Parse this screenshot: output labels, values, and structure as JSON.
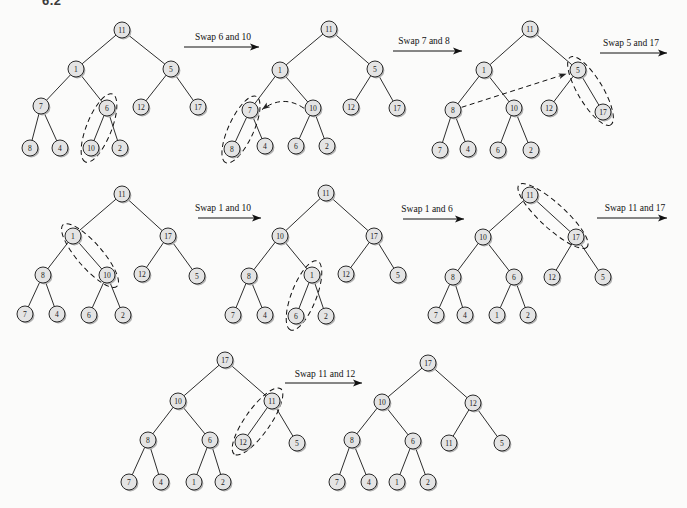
{
  "page": {
    "section_label": "6.2"
  },
  "colors": {
    "background": "#fbfbfa",
    "node_fill": "#e4e4e4",
    "node_stroke": "#2a2a2a",
    "node_shadow": "#b0b0b0",
    "edge": "#2e2e2e",
    "ink": "#111111"
  },
  "figure": {
    "type": "binary-tree-heapify-steps",
    "tree_edges": [
      [
        0,
        1
      ],
      [
        0,
        2
      ],
      [
        1,
        3
      ],
      [
        1,
        4
      ],
      [
        2,
        5
      ],
      [
        2,
        6
      ],
      [
        3,
        7
      ],
      [
        3,
        8
      ],
      [
        4,
        9
      ],
      [
        4,
        10
      ]
    ],
    "trees": [
      {
        "step": 1,
        "nodes": [
          {
            "v": "11",
            "x": 122,
            "y": 30
          },
          {
            "v": "1",
            "x": 76,
            "y": 69
          },
          {
            "v": "5",
            "x": 171,
            "y": 69
          },
          {
            "v": "7",
            "x": 41,
            "y": 106
          },
          {
            "v": "6",
            "x": 107,
            "y": 108
          },
          {
            "v": "12",
            "x": 141,
            "y": 107
          },
          {
            "v": "17",
            "x": 198,
            "y": 107
          },
          {
            "v": "8",
            "x": 30,
            "y": 148
          },
          {
            "v": "4",
            "x": 60,
            "y": 148
          },
          {
            "v": "10",
            "x": 91,
            "y": 148
          },
          {
            "v": "2",
            "x": 120,
            "y": 148
          }
        ],
        "highlight": [
          4,
          9
        ],
        "compare_arrow": null
      },
      {
        "step": 2,
        "nodes": [
          {
            "v": "11",
            "x": 329,
            "y": 29
          },
          {
            "v": "1",
            "x": 280,
            "y": 70
          },
          {
            "v": "5",
            "x": 375,
            "y": 69
          },
          {
            "v": "7",
            "x": 250,
            "y": 110
          },
          {
            "v": "10",
            "x": 313,
            "y": 108
          },
          {
            "v": "12",
            "x": 351,
            "y": 107
          },
          {
            "v": "17",
            "x": 397,
            "y": 108
          },
          {
            "v": "8",
            "x": 232,
            "y": 149
          },
          {
            "v": "4",
            "x": 265,
            "y": 146
          },
          {
            "v": "6",
            "x": 296,
            "y": 146
          },
          {
            "v": "2",
            "x": 327,
            "y": 146
          }
        ],
        "highlight": [
          3,
          7
        ],
        "compare_arrow": {
          "from": 4,
          "to": 3,
          "curve": true
        }
      },
      {
        "step": 3,
        "nodes": [
          {
            "v": "11",
            "x": 530,
            "y": 29
          },
          {
            "v": "1",
            "x": 484,
            "y": 70
          },
          {
            "v": "5",
            "x": 578,
            "y": 70
          },
          {
            "v": "8",
            "x": 453,
            "y": 110
          },
          {
            "v": "10",
            "x": 514,
            "y": 108
          },
          {
            "v": "12",
            "x": 549,
            "y": 108
          },
          {
            "v": "17",
            "x": 603,
            "y": 112
          },
          {
            "v": "7",
            "x": 440,
            "y": 150
          },
          {
            "v": "4",
            "x": 468,
            "y": 149
          },
          {
            "v": "6",
            "x": 498,
            "y": 150
          },
          {
            "v": "2",
            "x": 531,
            "y": 150
          }
        ],
        "highlight": [
          2,
          6
        ],
        "compare_arrow": {
          "from": 3,
          "to": 2,
          "curve": false
        }
      },
      {
        "step": 4,
        "nodes": [
          {
            "v": "11",
            "x": 122,
            "y": 194
          },
          {
            "v": "1",
            "x": 73,
            "y": 236
          },
          {
            "v": "17",
            "x": 168,
            "y": 236
          },
          {
            "v": "8",
            "x": 43,
            "y": 275
          },
          {
            "v": "10",
            "x": 107,
            "y": 275
          },
          {
            "v": "12",
            "x": 142,
            "y": 274
          },
          {
            "v": "5",
            "x": 197,
            "y": 276
          },
          {
            "v": "7",
            "x": 25,
            "y": 314
          },
          {
            "v": "4",
            "x": 57,
            "y": 314
          },
          {
            "v": "6",
            "x": 89,
            "y": 315
          },
          {
            "v": "2",
            "x": 123,
            "y": 315
          }
        ],
        "highlight": [
          1,
          4
        ],
        "compare_arrow": null
      },
      {
        "step": 5,
        "nodes": [
          {
            "v": "11",
            "x": 326,
            "y": 193
          },
          {
            "v": "10",
            "x": 280,
            "y": 236
          },
          {
            "v": "17",
            "x": 374,
            "y": 236
          },
          {
            "v": "8",
            "x": 249,
            "y": 276
          },
          {
            "v": "1",
            "x": 312,
            "y": 275
          },
          {
            "v": "12",
            "x": 346,
            "y": 274
          },
          {
            "v": "5",
            "x": 398,
            "y": 275
          },
          {
            "v": "7",
            "x": 233,
            "y": 315
          },
          {
            "v": "4",
            "x": 265,
            "y": 315
          },
          {
            "v": "6",
            "x": 296,
            "y": 316
          },
          {
            "v": "2",
            "x": 326,
            "y": 316
          }
        ],
        "highlight": [
          4,
          9
        ],
        "compare_arrow": null
      },
      {
        "step": 6,
        "nodes": [
          {
            "v": "11",
            "x": 530,
            "y": 195
          },
          {
            "v": "10",
            "x": 483,
            "y": 237
          },
          {
            "v": "17",
            "x": 576,
            "y": 237
          },
          {
            "v": "8",
            "x": 453,
            "y": 277
          },
          {
            "v": "6",
            "x": 514,
            "y": 277
          },
          {
            "v": "12",
            "x": 552,
            "y": 277
          },
          {
            "v": "5",
            "x": 603,
            "y": 277
          },
          {
            "v": "7",
            "x": 436,
            "y": 315
          },
          {
            "v": "4",
            "x": 465,
            "y": 315
          },
          {
            "v": "1",
            "x": 497,
            "y": 315
          },
          {
            "v": "2",
            "x": 528,
            "y": 315
          }
        ],
        "highlight": [
          0,
          2
        ],
        "compare_arrow": null
      },
      {
        "step": 7,
        "nodes": [
          {
            "v": "17",
            "x": 225,
            "y": 360
          },
          {
            "v": "10",
            "x": 178,
            "y": 401
          },
          {
            "v": "11",
            "x": 272,
            "y": 401
          },
          {
            "v": "8",
            "x": 148,
            "y": 440
          },
          {
            "v": "6",
            "x": 210,
            "y": 440
          },
          {
            "v": "12",
            "x": 243,
            "y": 442
          },
          {
            "v": "5",
            "x": 297,
            "y": 443
          },
          {
            "v": "7",
            "x": 129,
            "y": 482
          },
          {
            "v": "4",
            "x": 161,
            "y": 482
          },
          {
            "v": "1",
            "x": 194,
            "y": 482
          },
          {
            "v": "2",
            "x": 223,
            "y": 482
          }
        ],
        "highlight": [
          2,
          5
        ],
        "compare_arrow": null
      },
      {
        "step": 8,
        "nodes": [
          {
            "v": "17",
            "x": 428,
            "y": 363
          },
          {
            "v": "10",
            "x": 382,
            "y": 402
          },
          {
            "v": "12",
            "x": 473,
            "y": 403
          },
          {
            "v": "8",
            "x": 352,
            "y": 440
          },
          {
            "v": "6",
            "x": 413,
            "y": 441
          },
          {
            "v": "11",
            "x": 449,
            "y": 443
          },
          {
            "v": "5",
            "x": 502,
            "y": 443
          },
          {
            "v": "7",
            "x": 337,
            "y": 482
          },
          {
            "v": "4",
            "x": 369,
            "y": 482
          },
          {
            "v": "1",
            "x": 397,
            "y": 482
          },
          {
            "v": "2",
            "x": 428,
            "y": 482
          }
        ],
        "highlight": null,
        "compare_arrow": null
      }
    ],
    "swap_arrows": [
      {
        "label": "Swap 6 and 10",
        "x1": 184,
        "x2": 259,
        "y": 47,
        "label_cx": 223,
        "label_y": 40
      },
      {
        "label": "Swap 7 and 8",
        "x1": 393,
        "x2": 462,
        "y": 51,
        "label_cx": 424,
        "label_y": 44
      },
      {
        "label": "Swap 5 and 17",
        "x1": 600,
        "x2": 667,
        "y": 53,
        "label_cx": 631,
        "label_y": 46
      },
      {
        "label": "Swap 1 and 10",
        "x1": 198,
        "x2": 261,
        "y": 218,
        "label_cx": 223,
        "label_y": 211
      },
      {
        "label": "Swap 1 and 6",
        "x1": 403,
        "x2": 464,
        "y": 219,
        "label_cx": 427,
        "label_y": 212
      },
      {
        "label": "Swap 11 and 17",
        "x1": 597,
        "x2": 667,
        "y": 218,
        "label_cx": 635,
        "label_y": 211
      },
      {
        "label": "Swap 11 and 12",
        "x1": 285,
        "x2": 362,
        "y": 383,
        "label_cx": 325,
        "label_y": 377
      }
    ]
  }
}
